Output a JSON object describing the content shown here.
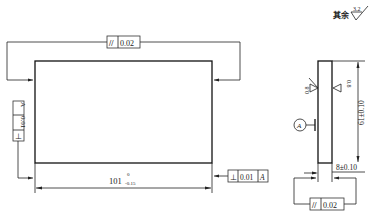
{
  "drawing": {
    "title_note": "其余",
    "general_roughness": "3.2",
    "front_view": {
      "length_dim": "101",
      "length_upper_dev": "0",
      "length_lower_dev": "-0.15",
      "top_fcf": {
        "symbol": "//",
        "tolerance": "0.02"
      },
      "left_fcf": {
        "symbol": "⊥",
        "tolerance": "0.01",
        "datum": "A"
      },
      "right_fcf": {
        "symbol": "⊥",
        "tolerance": "0.01",
        "datum": "A"
      }
    },
    "side_view": {
      "height_dim": "61±0.10",
      "thickness_dim": "8±0.10",
      "left_roughness": "0.8",
      "right_roughness": "0.8",
      "datum_label": "A",
      "bottom_fcf": {
        "symbol": "//",
        "tolerance": "0.02"
      }
    }
  },
  "colors": {
    "line": "#222222",
    "background": "#ffffff"
  }
}
